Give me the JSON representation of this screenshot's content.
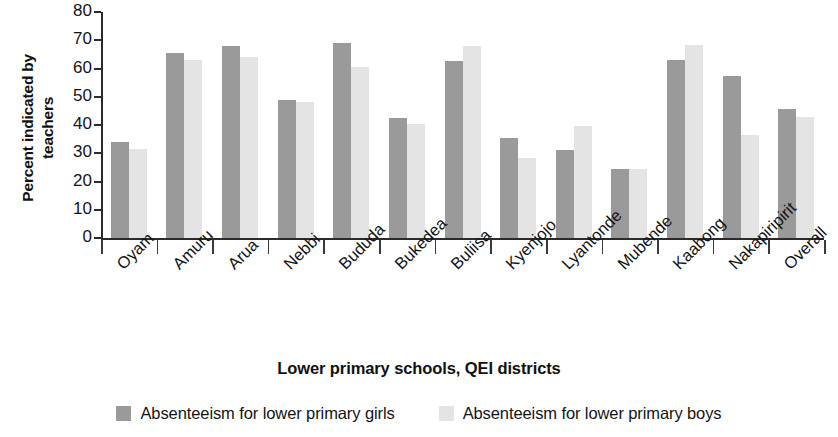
{
  "chart_data": {
    "type": "bar",
    "title": "",
    "xlabel": "Lower primary schools, QEI districts",
    "ylabel": "Percent indicated by teachers",
    "ylabel_line1": "Percent indicated by",
    "ylabel_line2": "teachers",
    "ylim": [
      0,
      80
    ],
    "ytick_labels": [
      "80",
      "70",
      "60",
      "50",
      "40",
      "30",
      "20",
      "10",
      "0"
    ],
    "ytick_values": [
      80,
      70,
      60,
      50,
      40,
      30,
      20,
      10,
      0
    ],
    "grid": false,
    "legend_position": "bottom-center",
    "categories": [
      "Oyam",
      "Amuru",
      "Arua",
      "Nebbi",
      "Bududa",
      "Bukedea",
      "Buliisa",
      "Kyenjojo",
      "Lyantonde",
      "Mubende",
      "Kaabong",
      "Nakapiripirit",
      "Overall"
    ],
    "series": [
      {
        "name": "Absenteeism for lower primary girls",
        "color": "#9a9a9a",
        "values": [
          34,
          65.5,
          68,
          49,
          69,
          42.5,
          62.5,
          35.5,
          31,
          24.5,
          63,
          57.5,
          45.5
        ]
      },
      {
        "name": "Absenteeism for lower primary boys",
        "color": "#e4e4e4",
        "values": [
          31.5,
          63,
          64,
          48,
          60.5,
          40.5,
          68,
          28.5,
          39.5,
          24.5,
          68.5,
          36.5,
          43
        ]
      }
    ]
  },
  "legend": {
    "items": [
      {
        "label": "Absenteeism for lower primary girls",
        "color": "#9a9a9a"
      },
      {
        "label": "Absenteeism for lower primary boys",
        "color": "#e4e4e4"
      }
    ]
  },
  "colors": {
    "girls": "#9a9a9a",
    "boys": "#e4e4e4",
    "axis": "#2b2b2b",
    "text": "#141414",
    "background": "#ffffff"
  }
}
